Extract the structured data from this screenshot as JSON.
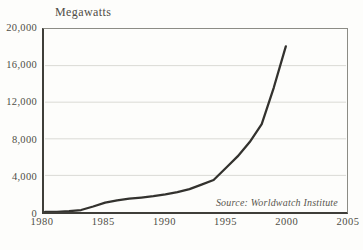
{
  "unit_label": "Megawatts",
  "source_note": "Source: Worldwatch Institute",
  "colors": {
    "background": "#fdfdfb",
    "text": "#4f4d46",
    "grid": "#d9d9d4",
    "plot_border": "#8c8c85",
    "axis": "#3f3e39",
    "line": "#33322e"
  },
  "chart_data": {
    "type": "line",
    "title": "Megawatts",
    "ylabel": "Megawatts",
    "xlabel": "",
    "xlim": [
      1980,
      2005
    ],
    "ylim": [
      0,
      20000
    ],
    "grid": "horizontal",
    "legend_position": "none",
    "x": [
      1980,
      1981,
      1982,
      1983,
      1984,
      1985,
      1986,
      1987,
      1988,
      1989,
      1990,
      1991,
      1992,
      1993,
      1994,
      1995,
      1996,
      1997,
      1998,
      1999,
      2000
    ],
    "values": [
      10,
      25,
      90,
      210,
      600,
      1020,
      1270,
      1450,
      1580,
      1730,
      1930,
      2170,
      2510,
      2990,
      3490,
      4780,
      6070,
      7640,
      9600,
      13600,
      18100
    ],
    "xticks": [
      "1980",
      "1985",
      "1990",
      "1995",
      "2000",
      "2005"
    ],
    "yticks": [
      "0",
      "4,000",
      "8,000",
      "12,000",
      "16,000",
      "20,000"
    ],
    "annotation": "Source: Worldwatch Institute"
  }
}
